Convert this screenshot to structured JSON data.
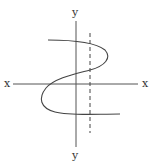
{
  "diagram": {
    "type": "relation-graph-vertical-line-test",
    "labels": {
      "y_top": "y",
      "y_bottom": "y",
      "x_left": "x",
      "x_right": "x"
    },
    "colors": {
      "axis": "#555555",
      "curve": "#444444",
      "dashed_line": "#444444",
      "background": "#ffffff"
    },
    "elements": {
      "x_axis": {
        "x1": 13,
        "y1": 84,
        "x2": 138,
        "y2": 84
      },
      "y_axis": {
        "x1": 76,
        "y1": 21,
        "x2": 76,
        "y2": 147
      },
      "dashed_vertical_line": {
        "x": 90,
        "y1": 33,
        "y2": 133,
        "dash": "4,3"
      },
      "curve": "M48,40 C70,40 95,42 105,50 C112,58 105,66 90,70 C75,74 55,78 46,88 C38,98 40,108 55,112 C70,116 95,114 120,114"
    }
  }
}
